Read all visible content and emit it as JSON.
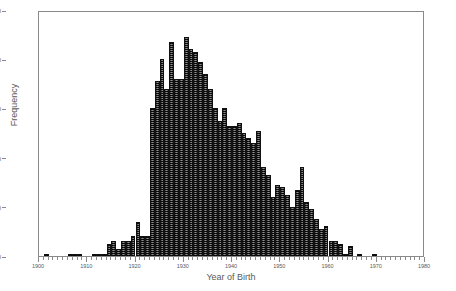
{
  "chart_data": {
    "type": "bar",
    "title": "",
    "xlabel": "Year of Birth",
    "ylabel": "Frequency",
    "xlim": [
      1900,
      1980
    ],
    "ylim": [
      0,
      100
    ],
    "grid": false,
    "legend": false,
    "bin_width": 1,
    "y_ticks": [
      0,
      20,
      40,
      60,
      80,
      100
    ],
    "y_tick_labels": [
      "0",
      "20",
      "40",
      "60",
      "80",
      "100"
    ],
    "x_ticks": [
      1900,
      1910,
      1920,
      1930,
      1940,
      1950,
      1960,
      1970,
      1980
    ],
    "x_tick_labels": [
      "1900",
      "1910",
      "1920",
      "1930",
      "1940",
      "1950",
      "1960",
      "1970",
      "1980"
    ],
    "x_minor_tick_interval": 1,
    "bar_color": "#3a3a3a",
    "frame_color": "#8a8a8a",
    "text_color": "#5a5a5a",
    "categories": [
      1900,
      1901,
      1902,
      1903,
      1904,
      1905,
      1906,
      1907,
      1908,
      1909,
      1910,
      1911,
      1912,
      1913,
      1914,
      1915,
      1916,
      1917,
      1918,
      1919,
      1920,
      1921,
      1922,
      1923,
      1924,
      1925,
      1926,
      1927,
      1928,
      1929,
      1930,
      1931,
      1932,
      1933,
      1934,
      1935,
      1936,
      1937,
      1938,
      1939,
      1940,
      1941,
      1942,
      1943,
      1944,
      1945,
      1946,
      1947,
      1948,
      1949,
      1950,
      1951,
      1952,
      1953,
      1954,
      1955,
      1956,
      1957,
      1958,
      1959,
      1960,
      1961,
      1962,
      1963,
      1964,
      1965,
      1966,
      1967,
      1968,
      1969,
      1970,
      1971,
      1972,
      1973,
      1974,
      1975,
      1976,
      1977,
      1978,
      1979
    ],
    "values": [
      0,
      1,
      0,
      0,
      0,
      0,
      1,
      1,
      1,
      0,
      0,
      1,
      1,
      1,
      5,
      6,
      3,
      6,
      6,
      8,
      14,
      8,
      8,
      60,
      71,
      80,
      68,
      87,
      72,
      72,
      89,
      84,
      83,
      79,
      74,
      68,
      60,
      55,
      60,
      53,
      53,
      54,
      50,
      48,
      46,
      51,
      36,
      33,
      24,
      29,
      28,
      25,
      20,
      27,
      36,
      22,
      19,
      15,
      11,
      12,
      6,
      6,
      5,
      1,
      4,
      0,
      1,
      0,
      0,
      1,
      0,
      0,
      0,
      0,
      0,
      0,
      0,
      0,
      0,
      0
    ]
  }
}
